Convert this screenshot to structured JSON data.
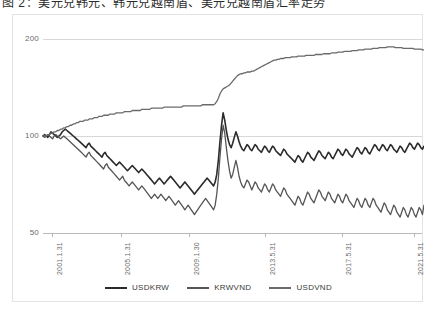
{
  "top_strip": {
    "text": "图 2：美元兑韩元、韩元兑越南盾、美元兑越南盾汇率走势"
  },
  "chart_data": {
    "type": "line",
    "title": "",
    "xlabel": "",
    "ylabel": "",
    "yscale": "log",
    "ylim": [
      50,
      200
    ],
    "ytick_labels": [
      "200",
      "100",
      "50"
    ],
    "ytick_values": [
      200,
      100,
      50
    ],
    "grid": "horizontal-only",
    "legend_position": "bottom-center",
    "x_tick_labels": [
      "2001.1.31",
      "2005.1.31",
      "2009.1.30",
      "2013.5.31",
      "2017.5.31",
      "2021.5.31"
    ],
    "x_range": [
      "2000.1.31",
      "2021.12.31"
    ],
    "series": [
      {
        "name": "USDKRW",
        "color": "#2b2b2b",
        "width": 1.6,
        "values": [
          100,
          101,
          100,
          99,
          101,
          103,
          102,
          101,
          100,
          99,
          100,
          101,
          103,
          104,
          105,
          104,
          103,
          102,
          101,
          100,
          99,
          98,
          97,
          96,
          95,
          94,
          93,
          92,
          94,
          95,
          93,
          92,
          91,
          90,
          89,
          88,
          87,
          86,
          88,
          89,
          87,
          86,
          85,
          84,
          83,
          82,
          81,
          82,
          83,
          82,
          81,
          80,
          79,
          78,
          79,
          80,
          81,
          80,
          79,
          78,
          77,
          78,
          79,
          78,
          77,
          76,
          75,
          74,
          73,
          72,
          71,
          72,
          73,
          74,
          73,
          72,
          71,
          72,
          73,
          74,
          75,
          74,
          73,
          72,
          71,
          70,
          69,
          70,
          71,
          72,
          71,
          70,
          69,
          68,
          67,
          66,
          67,
          68,
          69,
          70,
          71,
          72,
          73,
          74,
          73,
          72,
          71,
          70,
          72,
          76,
          84,
          96,
          108,
          118,
          112,
          104,
          98,
          94,
          92,
          95,
          99,
          103,
          100,
          96,
          93,
          91,
          90,
          92,
          94,
          93,
          91,
          90,
          92,
          94,
          93,
          91,
          90,
          89,
          91,
          93,
          92,
          90,
          89,
          91,
          93,
          92,
          90,
          89,
          88,
          87,
          89,
          91,
          90,
          88,
          87,
          86,
          85,
          84,
          83,
          85,
          87,
          86,
          84,
          83,
          85,
          87,
          89,
          88,
          86,
          85,
          84,
          86,
          88,
          90,
          89,
          87,
          86,
          85,
          87,
          89,
          88,
          86,
          85,
          87,
          89,
          91,
          90,
          88,
          87,
          89,
          91,
          90,
          88,
          87,
          86,
          88,
          90,
          92,
          91,
          89,
          88,
          90,
          92,
          91,
          89,
          88,
          90,
          92,
          94,
          93,
          91,
          90,
          92,
          94,
          93,
          91,
          90,
          92,
          94,
          93,
          91,
          90,
          89,
          91,
          93,
          92,
          90,
          89,
          91,
          93,
          95,
          94,
          92,
          91,
          93,
          95,
          94,
          92,
          91,
          93
        ]
      },
      {
        "name": "KRWVND",
        "color": "#555555",
        "width": 1.3,
        "values": [
          100,
          99,
          100,
          101,
          100,
          99,
          98,
          100,
          101,
          100,
          99,
          98,
          99,
          100,
          99,
          98,
          97,
          96,
          95,
          94,
          93,
          92,
          91,
          90,
          89,
          88,
          87,
          86,
          88,
          89,
          87,
          86,
          85,
          84,
          83,
          82,
          81,
          80,
          79,
          81,
          82,
          80,
          79,
          78,
          77,
          76,
          75,
          74,
          73,
          74,
          75,
          73,
          72,
          71,
          70,
          71,
          72,
          71,
          70,
          69,
          68,
          69,
          70,
          69,
          68,
          67,
          66,
          65,
          64,
          65,
          66,
          65,
          64,
          65,
          66,
          65,
          64,
          63,
          64,
          65,
          64,
          63,
          62,
          61,
          62,
          63,
          62,
          61,
          60,
          59,
          60,
          61,
          60,
          59,
          58,
          57,
          58,
          59,
          60,
          61,
          62,
          63,
          64,
          63,
          62,
          61,
          60,
          59,
          61,
          66,
          74,
          86,
          98,
          108,
          102,
          92,
          84,
          78,
          74,
          76,
          80,
          84,
          80,
          75,
          72,
          70,
          69,
          71,
          73,
          72,
          70,
          68,
          70,
          72,
          71,
          69,
          68,
          67,
          69,
          71,
          70,
          68,
          67,
          69,
          71,
          70,
          68,
          67,
          66,
          65,
          67,
          69,
          68,
          66,
          65,
          64,
          63,
          62,
          61,
          63,
          65,
          64,
          62,
          61,
          63,
          65,
          67,
          66,
          64,
          63,
          62,
          64,
          66,
          68,
          67,
          65,
          64,
          63,
          65,
          67,
          66,
          64,
          63,
          62,
          64,
          66,
          65,
          63,
          62,
          64,
          66,
          65,
          63,
          62,
          61,
          60,
          62,
          64,
          63,
          61,
          60,
          62,
          64,
          63,
          61,
          60,
          62,
          64,
          63,
          61,
          60,
          59,
          58,
          60,
          62,
          61,
          59,
          58,
          57,
          59,
          61,
          60,
          58,
          57,
          56,
          58,
          60,
          59,
          57,
          56,
          58,
          60,
          59,
          57,
          56,
          58,
          60,
          59,
          57,
          61
        ]
      },
      {
        "name": "USDVND",
        "color": "#6a6a6a",
        "width": 1.3,
        "values": [
          100,
          100,
          100,
          101,
          101,
          102,
          102,
          103,
          103,
          104,
          104,
          105,
          105,
          106,
          106,
          107,
          107,
          108,
          108,
          109,
          109,
          110,
          110,
          111,
          111,
          111,
          112,
          112,
          112,
          113,
          113,
          113,
          114,
          114,
          114,
          115,
          115,
          115,
          116,
          116,
          116,
          116,
          117,
          117,
          117,
          117,
          118,
          118,
          118,
          118,
          118,
          119,
          119,
          119,
          119,
          119,
          120,
          120,
          120,
          120,
          120,
          120,
          121,
          121,
          121,
          121,
          121,
          121,
          122,
          122,
          122,
          122,
          122,
          122,
          122,
          122,
          123,
          123,
          123,
          123,
          123,
          123,
          123,
          123,
          123,
          123,
          123,
          123,
          124,
          124,
          124,
          124,
          124,
          124,
          124,
          124,
          124,
          124,
          124,
          124,
          125,
          125,
          125,
          125,
          125,
          125,
          125,
          125,
          126,
          128,
          131,
          135,
          138,
          140,
          141,
          142,
          143,
          144,
          146,
          148,
          150,
          152,
          154,
          155,
          156,
          156,
          157,
          157,
          158,
          158,
          158,
          159,
          159,
          160,
          161,
          162,
          163,
          164,
          165,
          166,
          167,
          168,
          169,
          170,
          171,
          172,
          172,
          173,
          173,
          174,
          174,
          174,
          175,
          175,
          175,
          175,
          176,
          176,
          176,
          176,
          177,
          177,
          177,
          177,
          177,
          178,
          178,
          178,
          178,
          178,
          178,
          179,
          179,
          179,
          179,
          179,
          180,
          180,
          180,
          180,
          180,
          181,
          181,
          181,
          181,
          182,
          182,
          182,
          182,
          183,
          183,
          183,
          183,
          183,
          184,
          184,
          184,
          184,
          185,
          185,
          185,
          185,
          186,
          186,
          186,
          186,
          186,
          187,
          187,
          187,
          187,
          188,
          188,
          188,
          188,
          188,
          189,
          189,
          189,
          189,
          189,
          188,
          188,
          188,
          188,
          188,
          187,
          187,
          187,
          187,
          187,
          187,
          187,
          186,
          186,
          186,
          186,
          186,
          185,
          185
        ]
      }
    ]
  },
  "legend": {
    "items": [
      {
        "label": "USDKRW",
        "color": "#2b2b2b"
      },
      {
        "label": "KRWVND",
        "color": "#555555"
      },
      {
        "label": "USDVND",
        "color": "#6a6a6a"
      }
    ]
  }
}
